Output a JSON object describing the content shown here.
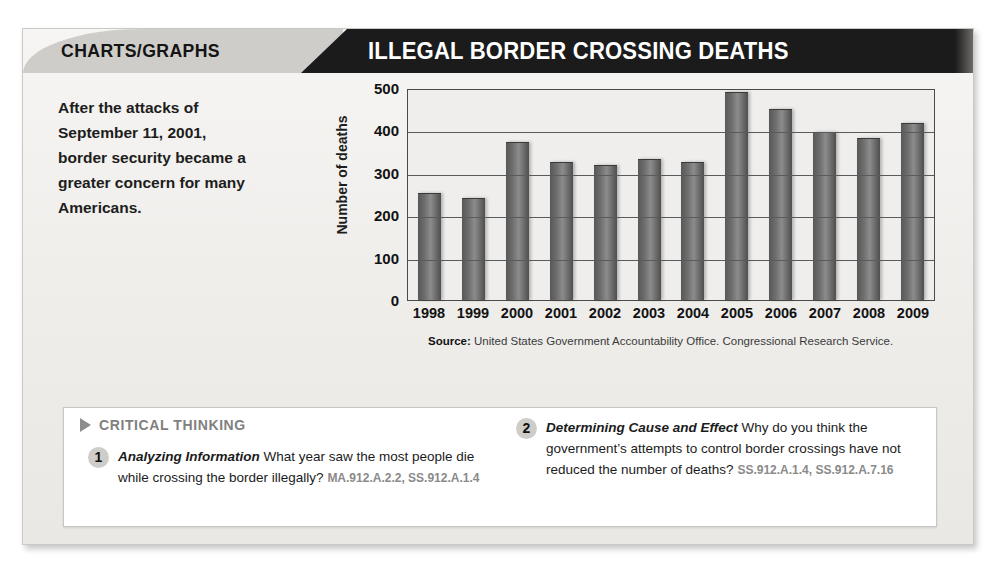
{
  "header": {
    "kicker": "CHARTS/GRAPHS",
    "title": "ILLEGAL BORDER CROSSING DEATHS"
  },
  "intro": {
    "text": "After the attacks of September 11, 2001, border security became a greater concern for many Americans."
  },
  "chart_data": {
    "type": "bar",
    "title": "ILLEGAL BORDER CROSSING DEATHS",
    "xlabel": "",
    "ylabel": "Number of deaths",
    "ylim": [
      0,
      500
    ],
    "yticks": [
      500,
      400,
      300,
      200,
      100,
      0
    ],
    "grid": true,
    "legend": false,
    "categories": [
      "1998",
      "1999",
      "2000",
      "2001",
      "2002",
      "2003",
      "2004",
      "2005",
      "2006",
      "2007",
      "2008",
      "2009"
    ],
    "values": [
      250,
      238,
      370,
      322,
      315,
      330,
      322,
      488,
      448,
      393,
      380,
      415
    ],
    "source": "United States Government Accountability Office. Congressional Research Service."
  },
  "source_label": "Source:",
  "critical_thinking": {
    "heading": "CRITICAL THINKING",
    "questions": [
      {
        "number": "1",
        "title": "Analyzing Information",
        "text": "What year saw the most people die while crossing the border illegally?",
        "standards": "MA.912.A.2.2, SS.912.A.1.4"
      },
      {
        "number": "2",
        "title": "Determining Cause and Effect",
        "text": "Why do you think the government’s attempts to control border crossings have not reduced the number of deaths?",
        "standards": "SS.912.A.1.4, SS.912.A.7.16"
      }
    ]
  },
  "colors": {
    "header_black": "#1b1b1b",
    "header_grey": "#cfcdc9",
    "bar": "#6d6d6d",
    "card_bg": "#f2f1ef"
  }
}
